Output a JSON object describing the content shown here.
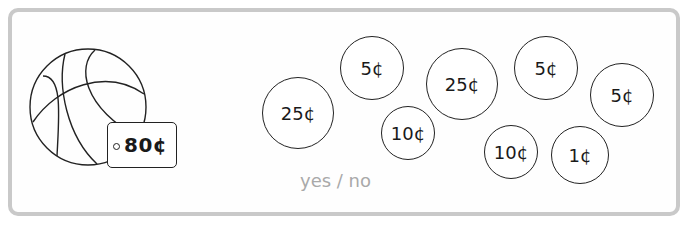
{
  "item": {
    "name": "basketball",
    "icon": "basketball-icon",
    "price_label": "80¢"
  },
  "coins": [
    {
      "label": "25¢",
      "cx": 298,
      "cy": 113,
      "r": 36
    },
    {
      "label": "5¢",
      "cx": 372,
      "cy": 68,
      "r": 32
    },
    {
      "label": "10¢",
      "cx": 408,
      "cy": 133,
      "r": 27
    },
    {
      "label": "25¢",
      "cx": 462,
      "cy": 84,
      "r": 36
    },
    {
      "label": "5¢",
      "cx": 546,
      "cy": 68,
      "r": 32
    },
    {
      "label": "10¢",
      "cx": 511,
      "cy": 152,
      "r": 27
    },
    {
      "label": "1¢",
      "cx": 580,
      "cy": 155,
      "r": 29
    },
    {
      "label": "5¢",
      "cx": 622,
      "cy": 95,
      "r": 32
    }
  ],
  "answer": {
    "options_label": "yes / no"
  },
  "colors": {
    "frame": "#c9c9c9",
    "ink": "#222222",
    "answer_text": "#a9a9a9"
  }
}
